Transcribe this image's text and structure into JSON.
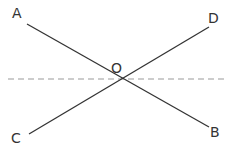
{
  "diagram": {
    "type": "intersecting-lines",
    "points": {
      "A": {
        "label": "A",
        "x": 27,
        "y": 24
      },
      "B": {
        "label": "B",
        "x": 209,
        "y": 127
      },
      "C": {
        "label": "C",
        "x": 29,
        "y": 134
      },
      "D": {
        "label": "D",
        "x": 209,
        "y": 27
      },
      "O": {
        "label": "O",
        "x": 117,
        "y": 79
      }
    },
    "segments": [
      {
        "name": "AB",
        "from": "A",
        "to": "B",
        "style": "solid"
      },
      {
        "name": "CD",
        "from": "C",
        "to": "D",
        "style": "solid"
      }
    ],
    "dashed_line": {
      "y": 79,
      "x1": 8,
      "x2": 228,
      "style": "dashed"
    },
    "colors": {
      "line": "#333333",
      "dashed": "#9a9a9a",
      "background": "#ffffff"
    }
  }
}
